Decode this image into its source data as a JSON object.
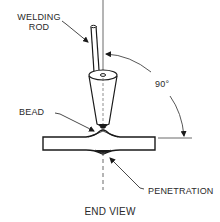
{
  "diagram": {
    "caption": "END VIEW",
    "labels": {
      "welding_rod_line1": "WELDING",
      "welding_rod_line2": "ROD",
      "bead": "BEAD",
      "penetration": "PENETRATION",
      "angle": "90°"
    },
    "colors": {
      "stroke": "#1a1a1a",
      "text": "#2a2a2a",
      "background": "#ffffff"
    }
  }
}
